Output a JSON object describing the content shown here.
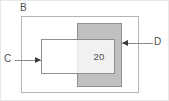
{
  "figure": {
    "width": 169,
    "height": 101,
    "background_color": "#ffffff",
    "frame_color": "#e8e8e8"
  },
  "labels": {
    "outer_rect": "B",
    "white_rect": "C",
    "gray_rect": "D"
  },
  "values": {
    "overlap_value": "20"
  },
  "shapes": {
    "outer_rect": {
      "name": "B",
      "fill": "none",
      "stroke": "#b5b5b5",
      "x": 21,
      "y": 16,
      "width": 118,
      "height": 77
    },
    "gray_rect": {
      "name": "D",
      "fill": "#c0c0c0",
      "stroke": "#8f8f8f",
      "x": 77,
      "y": 23,
      "width": 45,
      "height": 64
    },
    "white_rect": {
      "name": "C",
      "fill": "#ffffff",
      "stroke": "#8f8f8f",
      "x": 41,
      "y": 39,
      "width": 74,
      "height": 35
    }
  },
  "annotations": [
    {
      "label": "B",
      "kind": "text-label",
      "target": "outer_rect"
    },
    {
      "label": "C",
      "kind": "leader-arrow",
      "target": "white_rect",
      "direction": "right"
    },
    {
      "label": "D",
      "kind": "leader-arrow",
      "target": "gray_rect",
      "direction": "left"
    },
    {
      "label": "20",
      "kind": "inline-value",
      "target": "overlap-region"
    }
  ],
  "chart_data": {
    "type": "diagram",
    "title": "",
    "sets": [
      {
        "name": "B",
        "role": "universe",
        "fill": "none"
      },
      {
        "name": "C",
        "role": "set",
        "fill": "#ffffff"
      },
      {
        "name": "D",
        "role": "set",
        "fill": "#c0c0c0"
      }
    ],
    "regions": [
      {
        "name": "C ∩ D",
        "value": 20,
        "label": "20"
      }
    ]
  }
}
